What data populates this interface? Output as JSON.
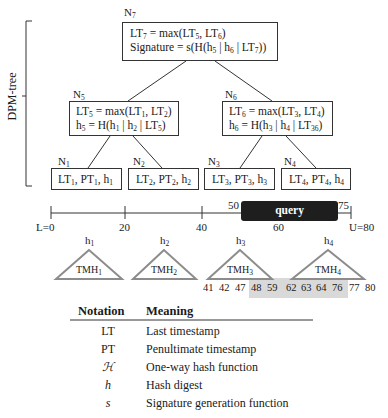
{
  "side_label": "DPM-tree",
  "nodes": {
    "N7": {
      "label": "N",
      "sub": "7",
      "line1": [
        "LT",
        "7",
        " = max(LT",
        "5",
        ", LT",
        "6",
        ")"
      ],
      "line2": [
        "Signature = s(H(h",
        "5",
        " | h",
        "6",
        " | LT",
        "7",
        "))"
      ]
    },
    "N5": {
      "label": "N",
      "sub": "5",
      "line1": [
        "LT",
        "5",
        " = max(LT",
        "1",
        ", LT",
        "2",
        ")"
      ],
      "line2": [
        "h",
        "5",
        " = H(h",
        "1",
        " | h",
        "2",
        " | LT",
        "5",
        ")"
      ]
    },
    "N6": {
      "label": "N",
      "sub": "6",
      "line1": [
        "LT",
        "6",
        " = max(LT",
        "3",
        ", LT",
        "4",
        ")"
      ],
      "line2": [
        "h",
        "6",
        " = H(h",
        "3",
        " | h",
        "4",
        " | LT",
        "36",
        ")"
      ]
    },
    "N1": {
      "label": "N",
      "sub": "1",
      "line1": [
        "LT",
        "1",
        ", PT",
        "1",
        ", h",
        "1",
        ""
      ]
    },
    "N2": {
      "label": "N",
      "sub": "2",
      "line1": [
        "LT",
        "2",
        ", PT",
        "2",
        ", h",
        "2",
        ""
      ]
    },
    "N3": {
      "label": "N",
      "sub": "3",
      "line1": [
        "LT",
        "3",
        ", PT",
        "3",
        ", h",
        "3",
        ""
      ]
    },
    "N4": {
      "label": "N",
      "sub": "4",
      "line1": [
        "LT",
        "4",
        ", PT",
        "4",
        ", h",
        "4",
        ""
      ]
    }
  },
  "timeline": {
    "ticks": [
      "L=0",
      "20",
      "40",
      "60",
      "U=80"
    ],
    "query_label": "query",
    "query_start": "50",
    "query_end": "75"
  },
  "tmh": [
    {
      "hash": "h",
      "hash_sub": "1",
      "name": "TMH",
      "name_sub": "1"
    },
    {
      "hash": "h",
      "hash_sub": "2",
      "name": "TMH",
      "name_sub": "2"
    },
    {
      "hash": "h",
      "hash_sub": "3",
      "name": "TMH",
      "name_sub": "3"
    },
    {
      "hash": "h",
      "hash_sub": "4",
      "name": "TMH",
      "name_sub": "4"
    }
  ],
  "timestamps": [
    "41",
    "42",
    "47",
    "48",
    "59",
    "62",
    "63",
    "64",
    "76",
    "77",
    "80"
  ],
  "highlighted_timestamps": [
    "48",
    "59",
    "62",
    "63",
    "64",
    "76"
  ],
  "legend": {
    "header": {
      "notation": "Notation",
      "meaning": "Meaning"
    },
    "rows": [
      {
        "symbol": "LT",
        "meaning": "Last timestamp"
      },
      {
        "symbol": "PT",
        "meaning": "Penultimate timestamp"
      },
      {
        "symbol": "ℋ",
        "meaning": "One-way hash function"
      },
      {
        "symbol": "h",
        "meaning": "Hash digest"
      },
      {
        "symbol": "s",
        "meaning": "Signature generation function"
      }
    ]
  },
  "colors": {
    "query_fill": "#1e1e1e",
    "shade": "#d9d9d9",
    "triangle": "#8c8c8c",
    "line": "#333333"
  }
}
